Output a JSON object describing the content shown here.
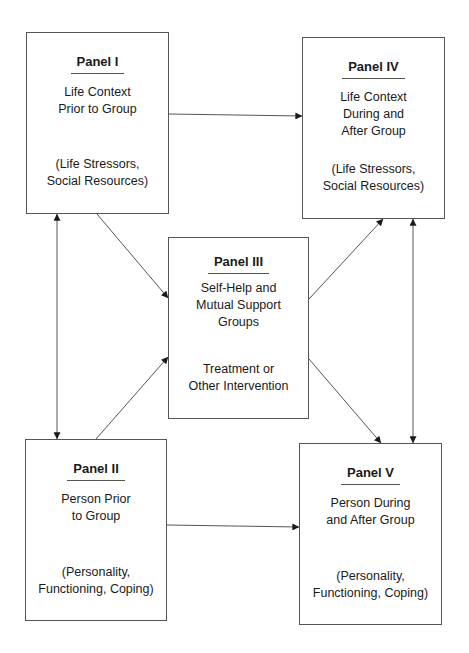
{
  "diagram": {
    "type": "flow",
    "panels": {
      "p1": {
        "title": "Panel I",
        "desc": [
          "Life Context",
          "Prior to Group"
        ],
        "note": [
          "(Life Stressors,",
          "Social Resources)"
        ]
      },
      "p2": {
        "title": "Panel II",
        "desc": [
          "Person Prior",
          "to Group"
        ],
        "note": [
          "(Personality,",
          "Functioning, Coping)"
        ]
      },
      "p3": {
        "title": "Panel III",
        "desc": [
          "Self-Help and",
          "Mutual Support",
          "Groups"
        ],
        "after": [
          "Treatment or",
          "Other Intervention"
        ]
      },
      "p4": {
        "title": "Panel IV",
        "desc": [
          "Life Context",
          "During and",
          "After Group"
        ],
        "note": [
          "(Life Stressors,",
          "Social Resources)"
        ]
      },
      "p5": {
        "title": "Panel V",
        "desc": [
          "Person During",
          "and After Group"
        ],
        "note": [
          "(Personality,",
          "Functioning, Coping)"
        ]
      }
    },
    "edges": [
      {
        "from": "Panel I",
        "to": "Panel IV",
        "direction": "one-way"
      },
      {
        "from": "Panel II",
        "to": "Panel V",
        "direction": "one-way"
      },
      {
        "from": "Panel I",
        "to": "Panel II",
        "direction": "bidirectional"
      },
      {
        "from": "Panel IV",
        "to": "Panel V",
        "direction": "bidirectional"
      },
      {
        "from": "Panel I",
        "to": "Panel III",
        "direction": "one-way"
      },
      {
        "from": "Panel II",
        "to": "Panel III",
        "direction": "one-way"
      },
      {
        "from": "Panel III",
        "to": "Panel IV",
        "direction": "one-way"
      },
      {
        "from": "Panel III",
        "to": "Panel V",
        "direction": "one-way"
      },
      {
        "from": "Self-Help and Mutual Support Groups",
        "to": "Treatment or Other Intervention",
        "direction": "bidirectional-pair"
      }
    ],
    "colors": {
      "line": "#555555",
      "text": "#1a1a1a",
      "background": "#ffffff"
    }
  }
}
